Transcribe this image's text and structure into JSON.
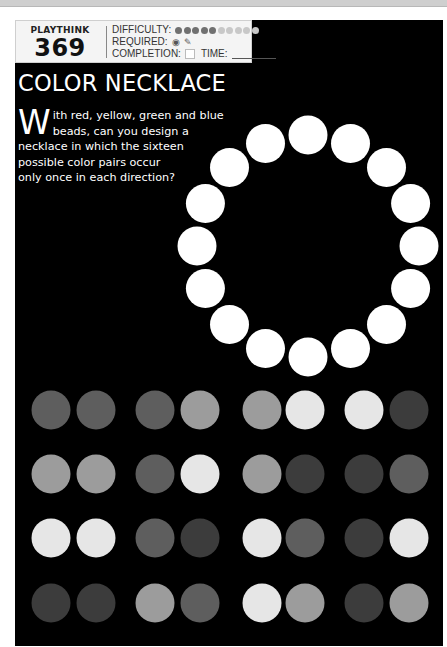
{
  "header": {
    "brand": "PLAYTHINK",
    "number": "369",
    "difficulty_label": "DIFFICULTY:",
    "difficulty": {
      "filled": 5,
      "total": 10
    },
    "required_label": "REQUIRED:",
    "required_icons": [
      "eye-icon",
      "pencil-icon"
    ],
    "completion_label": "COMPLETION:",
    "time_label": "TIME:"
  },
  "puzzle": {
    "title": "COLOR NECKLACE",
    "drop_cap": "W",
    "text_lines": [
      "ith red, yellow, green and blue",
      "beads, can you design a",
      "necklace in which the sixteen",
      "possible color pairs occur",
      "only once in each direction?"
    ]
  },
  "necklace": {
    "bead_count": 16,
    "bead_color": "#ffffff"
  },
  "palette": {
    "A": "#5e5e5e",
    "B": "#9c9c9c",
    "C": "#e6e6e6",
    "D": "#3c3c3c"
  },
  "color_pairs": [
    [
      [
        "A",
        "A"
      ],
      [
        "A",
        "B"
      ],
      [
        "B",
        "C"
      ],
      [
        "C",
        "D"
      ]
    ],
    [
      [
        "B",
        "B"
      ],
      [
        "A",
        "C"
      ],
      [
        "B",
        "D"
      ],
      [
        "D",
        "A"
      ]
    ],
    [
      [
        "C",
        "C"
      ],
      [
        "A",
        "D"
      ],
      [
        "C",
        "A"
      ],
      [
        "D",
        "C"
      ]
    ],
    [
      [
        "D",
        "D"
      ],
      [
        "B",
        "A"
      ],
      [
        "C",
        "B"
      ],
      [
        "D",
        "B"
      ]
    ]
  ]
}
